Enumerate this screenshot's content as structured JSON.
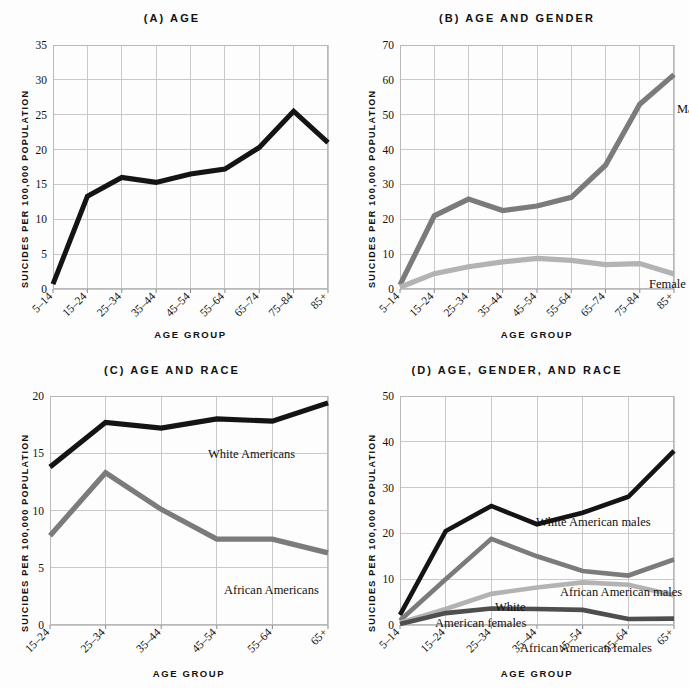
{
  "figure": {
    "axis_titles": {
      "x": "AGE GROUP",
      "y": "SUICIDES PER 100,000 POPULATION"
    },
    "colors": {
      "black": "#141414",
      "mid_gray": "#7b7b7b",
      "light_gray": "#b3b3b3",
      "dark_gray": "#4e4e4e",
      "grid": "#c9c9c9",
      "frame": "#b9b9b9",
      "background": "#fdfdfd"
    }
  },
  "chart_data": [
    {
      "id": "panel-a",
      "type": "line",
      "title": "(A) AGE",
      "xlabel": "AGE GROUP",
      "ylabel": "SUICIDES PER 100,000 POPULATION",
      "categories": [
        "5–14",
        "15–24",
        "25–34",
        "35–44",
        "45–54",
        "55–64",
        "65–74",
        "75–84",
        "85+"
      ],
      "ylim": [
        0,
        35
      ],
      "yticks": [
        0,
        5,
        10,
        15,
        20,
        25,
        30,
        35
      ],
      "grid": true,
      "legend": "none",
      "series": [
        {
          "name": "All",
          "color": "#141414",
          "values": [
            0.7,
            13.3,
            16.0,
            15.3,
            16.5,
            17.2,
            20.3,
            25.5,
            21.0
          ]
        }
      ]
    },
    {
      "id": "panel-b",
      "type": "line",
      "title": "(B) AGE AND GENDER",
      "xlabel": "AGE GROUP",
      "ylabel": "SUICIDES PER 100,000 POPULATION",
      "categories": [
        "5–14",
        "15–24",
        "25–34",
        "35–44",
        "45–54",
        "55–64",
        "65–74",
        "75–84",
        "85+"
      ],
      "ylim": [
        0,
        70
      ],
      "yticks": [
        0,
        10,
        20,
        30,
        40,
        50,
        60,
        70
      ],
      "grid": true,
      "legend": "inline-labels",
      "series": [
        {
          "name": "Male",
          "color": "#7b7b7b",
          "values": [
            1.2,
            21.0,
            25.8,
            22.5,
            23.8,
            26.3,
            35.5,
            53.0,
            61.5
          ]
        },
        {
          "name": "Female",
          "color": "#b3b3b3",
          "values": [
            0.5,
            4.4,
            6.4,
            7.8,
            8.8,
            8.2,
            7.0,
            7.3,
            4.3
          ]
        }
      ]
    },
    {
      "id": "panel-c",
      "type": "line",
      "title": "(C) AGE AND RACE",
      "xlabel": "AGE GROUP",
      "ylabel": "SUICIDES PER 100,000 POPULATION",
      "categories": [
        "15–24",
        "25–34",
        "35–44",
        "45–54",
        "55–64",
        "65+"
      ],
      "ylim": [
        0,
        20
      ],
      "yticks": [
        0,
        5,
        10,
        15,
        20
      ],
      "grid": true,
      "legend": "inline-labels",
      "series": [
        {
          "name": "White Americans",
          "color": "#141414",
          "values": [
            13.8,
            17.7,
            17.2,
            18.0,
            17.8,
            19.4
          ]
        },
        {
          "name": "African Americans",
          "color": "#7b7b7b",
          "values": [
            7.8,
            13.3,
            10.1,
            7.5,
            7.5,
            6.3
          ]
        }
      ]
    },
    {
      "id": "panel-d",
      "type": "line",
      "title": "(D) AGE, GENDER, AND RACE",
      "xlabel": "AGE GROUP",
      "ylabel": "SUICIDES PER 100,000 POPULATION",
      "categories": [
        "5–14",
        "15–24",
        "25–34",
        "35–44",
        "45–54",
        "55–64",
        "65+"
      ],
      "ylim": [
        0,
        50
      ],
      "yticks": [
        0,
        10,
        20,
        30,
        40,
        50
      ],
      "grid": true,
      "legend": "inline-labels",
      "series": [
        {
          "name": "White American males",
          "color": "#141414",
          "values": [
            2.2,
            20.5,
            26.0,
            22.0,
            24.5,
            28.0,
            38.0
          ]
        },
        {
          "name": "African American males",
          "color": "#7b7b7b",
          "values": [
            1.0,
            10.0,
            18.8,
            15.0,
            11.8,
            10.8,
            14.3
          ]
        },
        {
          "name": "White American females",
          "color": "#b3b3b3",
          "values": [
            0.5,
            3.5,
            6.8,
            8.2,
            9.3,
            8.8,
            6.5
          ]
        },
        {
          "name": "African American females",
          "color": "#4e4e4e",
          "values": [
            0.2,
            2.6,
            3.6,
            3.5,
            3.3,
            1.3,
            1.4
          ]
        }
      ]
    }
  ],
  "labels": {
    "panel_b": [
      {
        "text": "Male",
        "x": 277,
        "y": 68
      },
      {
        "text": "Female",
        "x": 249,
        "y": 243
      }
    ],
    "panel_c": [
      {
        "text": "White Americans",
        "x": 158,
        "y": 62
      },
      {
        "text": "African Americans",
        "x": 174,
        "y": 198
      }
    ],
    "panel_d": [
      {
        "text": "White American males",
        "x": 136,
        "y": 130
      },
      {
        "text": "African American males",
        "x": 160,
        "y": 200
      },
      {
        "text": "White",
        "x": 95,
        "y": 215
      },
      {
        "text": "American females",
        "x": 35,
        "y": 231
      },
      {
        "text": "African American females",
        "x": 120,
        "y": 256
      }
    ]
  }
}
